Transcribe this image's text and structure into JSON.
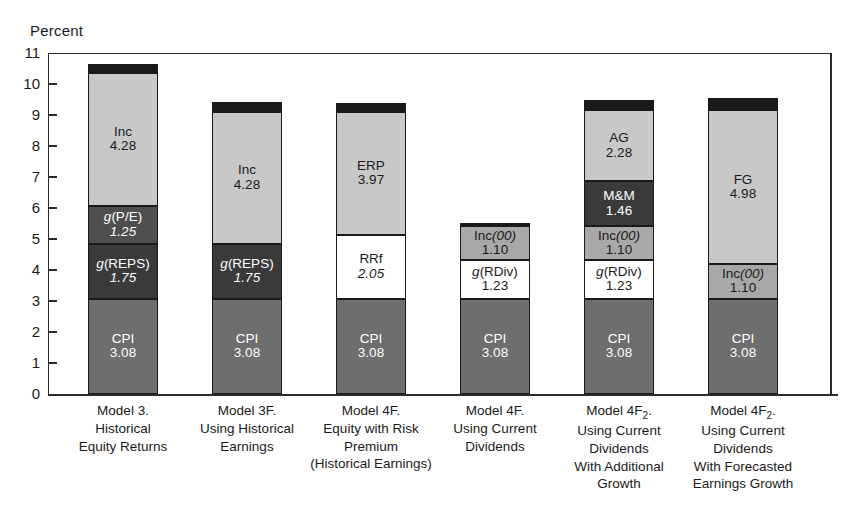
{
  "chart_data": {
    "type": "bar",
    "title": "",
    "subtitle": "",
    "ylabel": "Percent",
    "xlabel": "",
    "ylim": [
      0,
      11
    ],
    "yticks": [
      0,
      1,
      2,
      3,
      4,
      5,
      6,
      7,
      8,
      9,
      10,
      11
    ],
    "grid": false,
    "legend": "none",
    "stacked": true,
    "note": "Stacked bar decomposition of expected equity return models; each bar is topped by a thin black cap segment.",
    "categories": [
      "Model 3. Historical Equity Returns",
      "Model 3F. Using Historical Earnings",
      "Model 4F. Equity with Risk Premium (Historical Earnings)",
      "Model 4F. Using Current Dividends",
      "Model 4F2. Using Current Dividends With Additional Growth",
      "Model 4F2. Using Current Dividends With Forecasted Earnings Growth"
    ],
    "category_label_lines": [
      [
        "Model 3.",
        "Historical",
        "Equity Returns"
      ],
      [
        "Model 3F.",
        "Using Historical",
        "Earnings"
      ],
      [
        "Model 4F.",
        "Equity with Risk",
        "Premium",
        "(Historical Earnings)"
      ],
      [
        "Model 4F.",
        "Using Current",
        "Dividends"
      ],
      [
        "Model 4F₂.",
        "Using Current",
        "Dividends",
        "With Additional",
        "Growth"
      ],
      [
        "Model 4F₂.",
        "Using Current",
        "Dividends",
        "With Forecasted",
        "Earnings Growth"
      ]
    ],
    "totals": [
      10.66,
      9.41,
      9.4,
      5.51,
      9.5,
      9.56
    ],
    "bars": [
      {
        "category": "Model 3. Historical Equity Returns",
        "total": 10.66,
        "segments": [
          {
            "label": "CPI",
            "value": 3.08,
            "color": "#6e6e6e",
            "text_color": "#ffffff",
            "italic_value": false
          },
          {
            "label": "g(REPS)",
            "value": 1.75,
            "color": "#3a3a3a",
            "text_color": "#ffffff",
            "italic_value": true
          },
          {
            "label": "g(P/E)",
            "value": 1.25,
            "color": "#4e4e4e",
            "text_color": "#ffffff",
            "italic_value": true
          },
          {
            "label": "Inc",
            "value": 4.28,
            "color": "#c8c8c8",
            "text_color": "#1a1a1a",
            "italic_value": false
          },
          {
            "label": "",
            "value": 0.3,
            "color": "#1a1a1a",
            "text_color": "#ffffff",
            "italic_value": false
          }
        ]
      },
      {
        "category": "Model 3F. Using Historical Earnings",
        "total": 9.41,
        "segments": [
          {
            "label": "CPI",
            "value": 3.08,
            "color": "#6e6e6e",
            "text_color": "#ffffff",
            "italic_value": false
          },
          {
            "label": "g(REPS)",
            "value": 1.75,
            "color": "#3a3a3a",
            "text_color": "#ffffff",
            "italic_value": true
          },
          {
            "label": "Inc",
            "value": 4.28,
            "color": "#c8c8c8",
            "text_color": "#1a1a1a",
            "italic_value": false
          },
          {
            "label": "",
            "value": 0.3,
            "color": "#1a1a1a",
            "text_color": "#ffffff",
            "italic_value": false
          }
        ]
      },
      {
        "category": "Model 4F. Equity with Risk Premium (Historical Earnings)",
        "total": 9.4,
        "segments": [
          {
            "label": "CPI",
            "value": 3.08,
            "color": "#6e6e6e",
            "text_color": "#ffffff",
            "italic_value": false
          },
          {
            "label": "RRf",
            "value": 2.05,
            "color": "#ffffff",
            "text_color": "#1a1a1a",
            "italic_value": true
          },
          {
            "label": "ERP",
            "value": 3.97,
            "color": "#c8c8c8",
            "text_color": "#1a1a1a",
            "italic_value": false
          },
          {
            "label": "",
            "value": 0.3,
            "color": "#1a1a1a",
            "text_color": "#ffffff",
            "italic_value": false
          }
        ]
      },
      {
        "category": "Model 4F. Using Current Dividends",
        "total": 5.51,
        "segments": [
          {
            "label": "CPI",
            "value": 3.08,
            "color": "#6e6e6e",
            "text_color": "#ffffff",
            "italic_value": false
          },
          {
            "label": "g(RDiv)",
            "value": 1.23,
            "color": "#ffffff",
            "text_color": "#1a1a1a",
            "italic_value": false
          },
          {
            "label": "Inc(00)",
            "value": 1.1,
            "color": "#a8a8a8",
            "text_color": "#1a1a1a",
            "italic_value": false
          },
          {
            "label": "",
            "value": 0.1,
            "color": "#1a1a1a",
            "text_color": "#ffffff",
            "italic_value": false
          }
        ]
      },
      {
        "category": "Model 4F2. Using Current Dividends With Additional Growth",
        "total": 9.5,
        "segments": [
          {
            "label": "CPI",
            "value": 3.08,
            "color": "#6e6e6e",
            "text_color": "#ffffff",
            "italic_value": false
          },
          {
            "label": "g(RDiv)",
            "value": 1.23,
            "color": "#ffffff",
            "text_color": "#1a1a1a",
            "italic_value": false
          },
          {
            "label": "Inc(00)",
            "value": 1.1,
            "color": "#a8a8a8",
            "text_color": "#1a1a1a",
            "italic_value": false
          },
          {
            "label": "M&M",
            "value": 1.46,
            "color": "#3a3a3a",
            "text_color": "#ffffff",
            "italic_value": false
          },
          {
            "label": "AG",
            "value": 2.28,
            "color": "#c8c8c8",
            "text_color": "#1a1a1a",
            "italic_value": false
          },
          {
            "label": "",
            "value": 0.35,
            "color": "#1a1a1a",
            "text_color": "#ffffff",
            "italic_value": false
          }
        ]
      },
      {
        "category": "Model 4F2. Using Current Dividends With Forecasted Earnings Growth",
        "total": 9.56,
        "segments": [
          {
            "label": "CPI",
            "value": 3.08,
            "color": "#6e6e6e",
            "text_color": "#ffffff",
            "italic_value": false
          },
          {
            "label": "Inc(00)",
            "value": 1.1,
            "color": "#a8a8a8",
            "text_color": "#1a1a1a",
            "italic_value": false
          },
          {
            "label": "FG",
            "value": 4.98,
            "color": "#c8c8c8",
            "text_color": "#1a1a1a",
            "italic_value": false
          },
          {
            "label": "",
            "value": 0.4,
            "color": "#1a1a1a",
            "text_color": "#ffffff",
            "italic_value": false
          }
        ]
      }
    ]
  },
  "axis": {
    "y_title": "Percent",
    "tick_labels": [
      "0",
      "1",
      "2",
      "3",
      "4",
      "5",
      "6",
      "7",
      "8",
      "9",
      "10",
      "11"
    ]
  },
  "colors": {
    "cpi": "#6e6e6e",
    "dark": "#3a3a3a",
    "mid": "#a8a8a8",
    "light": "#c8c8c8",
    "white": "#ffffff",
    "cap": "#1a1a1a",
    "axis": "#2a2a2a",
    "background": "#ffffff"
  }
}
